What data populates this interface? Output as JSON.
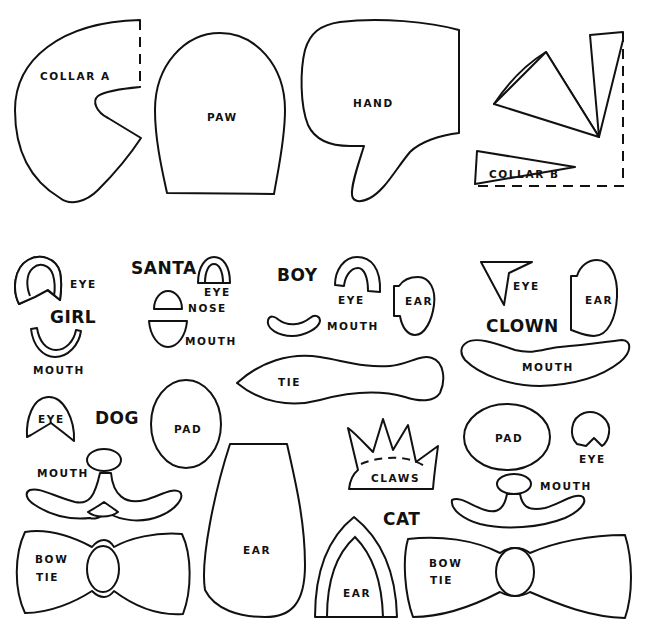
{
  "colors": {
    "ink": "#111111",
    "paper": "#ffffff"
  },
  "groups": {
    "santa": "SANTA",
    "girl": "GIRL",
    "boy": "BOY",
    "clown": "CLOWN",
    "dog": "DOG",
    "cat": "CAT"
  },
  "pieces": {
    "collar_a": "COLLAR A",
    "paw": "PAW",
    "hand": "HAND",
    "collar_b": "COLLAR B",
    "girl_eye": "EYE",
    "girl_mouth": "MOUTH",
    "santa_eye": "EYE",
    "santa_nose": "NOSE",
    "santa_mouth": "MOUTH",
    "boy_eye": "EYE",
    "boy_mouth": "MOUTH",
    "boy_ear": "EAR",
    "boy_tie": "TIE",
    "clown_eye": "EYE",
    "clown_ear": "EAR",
    "clown_mouth": "MOUTH",
    "dog_eye": "EYE",
    "dog_pad": "PAD",
    "dog_mouth": "MOUTH",
    "dog_bow_tie_1": "BOW",
    "dog_bow_tie_2": "TIE",
    "dog_ear": "EAR",
    "cat_claws": "CLAWS",
    "cat_pad": "PAD",
    "cat_eye": "EYE",
    "cat_mouth": "MOUTH",
    "cat_ear": "EAR",
    "cat_bow_tie_1": "BOW",
    "cat_bow_tie_2": "TIE"
  }
}
